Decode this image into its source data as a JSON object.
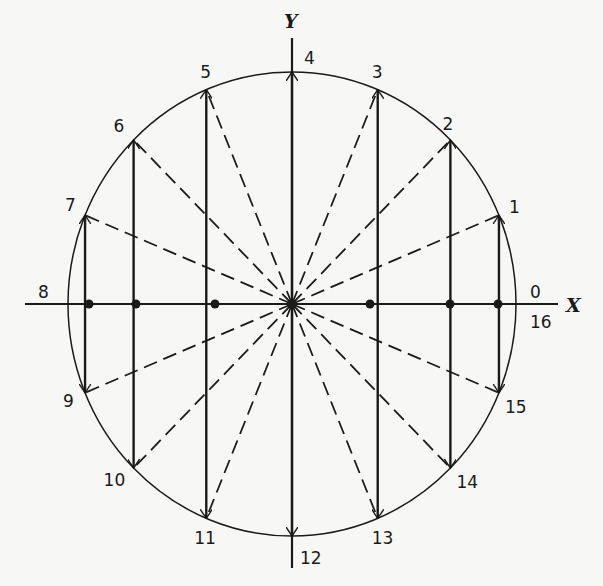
{
  "diagram": {
    "type": "circle-projection-diagram",
    "axes": {
      "x_label": "X",
      "y_label": "Y"
    },
    "center": {
      "x": 292,
      "y": 304
    },
    "radius": {
      "rx": 224,
      "ry": 232
    },
    "point_count": 16,
    "points": [
      {
        "index": 0,
        "label": "0",
        "angle_deg": 0
      },
      {
        "index": 1,
        "label": "1",
        "angle_deg": 22.5
      },
      {
        "index": 2,
        "label": "2",
        "angle_deg": 45
      },
      {
        "index": 3,
        "label": "3",
        "angle_deg": 67.5
      },
      {
        "index": 4,
        "label": "4",
        "angle_deg": 90
      },
      {
        "index": 5,
        "label": "5",
        "angle_deg": 112.5
      },
      {
        "index": 6,
        "label": "6",
        "angle_deg": 135
      },
      {
        "index": 7,
        "label": "7",
        "angle_deg": 157.5
      },
      {
        "index": 8,
        "label": "8",
        "angle_deg": 180
      },
      {
        "index": 9,
        "label": "9",
        "angle_deg": 202.5
      },
      {
        "index": 10,
        "label": "10",
        "angle_deg": 225
      },
      {
        "index": 11,
        "label": "11",
        "angle_deg": 247.5
      },
      {
        "index": 12,
        "label": "12",
        "angle_deg": 270
      },
      {
        "index": 13,
        "label": "13",
        "angle_deg": 292.5
      },
      {
        "index": 14,
        "label": "14",
        "angle_deg": 315
      },
      {
        "index": 15,
        "label": "15",
        "angle_deg": 337.5
      },
      {
        "index": 16,
        "label": "16",
        "angle_deg": 360
      }
    ],
    "label_offsets": {
      "0": [
        14,
        -6
      ],
      "16": [
        14,
        24
      ],
      "1": [
        10,
        -2
      ],
      "2": [
        -8,
        -10
      ],
      "3": [
        -6,
        -12
      ],
      "4": [
        12,
        -8
      ],
      "5": [
        -6,
        -12
      ],
      "6": [
        -20,
        -8
      ],
      "7": [
        -20,
        -4
      ],
      "8": [
        -30,
        -6
      ],
      "9": [
        -22,
        14
      ],
      "10": [
        -30,
        18
      ],
      "11": [
        -12,
        26
      ],
      "12": [
        8,
        28
      ],
      "13": [
        -6,
        26
      ],
      "14": [
        6,
        20
      ],
      "15": [
        6,
        20
      ]
    },
    "projection_dots_x": [
      89,
      136,
      215,
      292,
      370,
      450,
      498
    ],
    "colors": {
      "ink": "#1a1a1a",
      "background": "#f7f7f5"
    }
  }
}
